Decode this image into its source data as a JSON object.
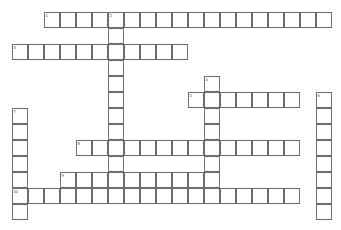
{
  "puzzle": {
    "title": "Crossword Puzzle Grid",
    "kind": "crossword-grid",
    "canvas": {
      "width": 341,
      "height": 230
    },
    "background_color": "#ffffff",
    "cell": {
      "size": 16,
      "border_color": "#6e6e6e",
      "fill_color": "#ffffff",
      "number_color": "#333333"
    },
    "geometry": {
      "origin_x": 12,
      "origin_y": 12,
      "columns": 20,
      "rows": 13
    },
    "entries": [
      {
        "number": "1",
        "direction": "across",
        "row": 0,
        "col": 2,
        "length": 18,
        "clue_label": "1 Across"
      },
      {
        "number": "2",
        "direction": "down",
        "row": 0,
        "col": 6,
        "length": 12,
        "clue_label": "2 Down"
      },
      {
        "number": "3",
        "direction": "across",
        "row": 2,
        "col": 0,
        "length": 11,
        "clue_label": "3 Across"
      },
      {
        "number": "4",
        "direction": "down",
        "row": 4,
        "col": 12,
        "length": 6,
        "clue_label": "4 Down"
      },
      {
        "number": "5",
        "direction": "across",
        "row": 5,
        "col": 11,
        "length": 7,
        "clue_label": "5 Across"
      },
      {
        "number": "6",
        "direction": "down",
        "row": 5,
        "col": 19,
        "length": 8,
        "clue_label": "6 Down"
      },
      {
        "number": "7",
        "direction": "down",
        "row": 6,
        "col": 0,
        "length": 7,
        "clue_label": "7 Down"
      },
      {
        "number": "8",
        "direction": "across",
        "row": 8,
        "col": 4,
        "length": 14,
        "clue_label": "8 Across"
      },
      {
        "number": "9",
        "direction": "across",
        "row": 10,
        "col": 3,
        "length": 10,
        "clue_label": "9 Across"
      },
      {
        "number": "10",
        "direction": "across",
        "row": 11,
        "col": 0,
        "length": 18,
        "clue_label": "10 Across"
      }
    ],
    "numbered_cells": [
      {
        "number": "1",
        "row": 0,
        "col": 2
      },
      {
        "number": "2",
        "row": 0,
        "col": 6
      },
      {
        "number": "3",
        "row": 2,
        "col": 0
      },
      {
        "number": "4",
        "row": 4,
        "col": 12
      },
      {
        "number": "5",
        "row": 5,
        "col": 11
      },
      {
        "number": "6",
        "row": 5,
        "col": 19
      },
      {
        "number": "7",
        "row": 6,
        "col": 0
      },
      {
        "number": "8",
        "row": 8,
        "col": 4
      },
      {
        "number": "9",
        "row": 10,
        "col": 3
      },
      {
        "number": "10",
        "row": 11,
        "col": 0
      }
    ],
    "letters": []
  }
}
